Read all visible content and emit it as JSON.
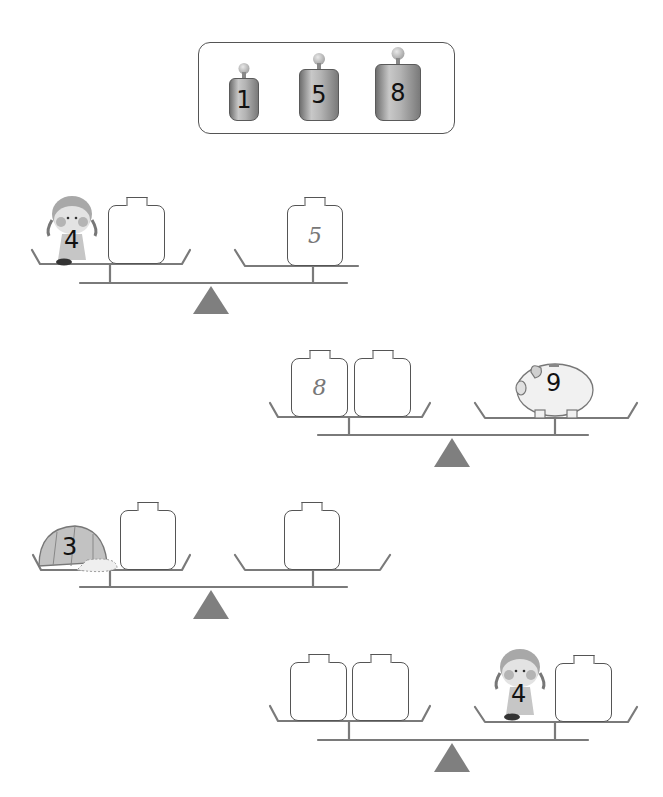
{
  "header": {
    "cut_off_text": [
      "▔▔",
      "▔ ▔▔",
      "▔▔▔",
      "▔ ▔▔▔",
      "▔▔",
      "▔▔▔▔"
    ]
  },
  "legend": {
    "title": "available weights",
    "weights": [
      {
        "label": "1"
      },
      {
        "label": "5"
      },
      {
        "label": "8"
      }
    ]
  },
  "colors": {
    "line": "#777777",
    "fulcrum": "#7f7f7f",
    "box_border": "#555555"
  },
  "scales": [
    {
      "left": {
        "items": [
          {
            "type": "girl-figure",
            "value": "4"
          },
          {
            "type": "weight-box",
            "value": ""
          }
        ]
      },
      "right": {
        "items": [
          {
            "type": "weight-box",
            "value": "5"
          }
        ]
      }
    },
    {
      "left": {
        "items": [
          {
            "type": "weight-box",
            "value": "8"
          },
          {
            "type": "weight-box",
            "value": ""
          }
        ]
      },
      "right": {
        "items": [
          {
            "type": "piggy-bank",
            "value": "9"
          }
        ]
      }
    },
    {
      "left": {
        "items": [
          {
            "type": "cap",
            "value": "3"
          },
          {
            "type": "weight-box",
            "value": ""
          }
        ]
      },
      "right": {
        "items": [
          {
            "type": "weight-box",
            "value": ""
          }
        ]
      }
    },
    {
      "left": {
        "items": [
          {
            "type": "weight-box",
            "value": ""
          },
          {
            "type": "weight-box",
            "value": ""
          }
        ]
      },
      "right": {
        "items": [
          {
            "type": "girl-figure",
            "value": "4"
          },
          {
            "type": "weight-box",
            "value": ""
          }
        ]
      }
    }
  ]
}
